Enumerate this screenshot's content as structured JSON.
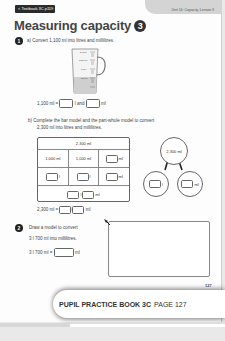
{
  "header": {
    "textbook_link": "< Textbook 3C p119",
    "unit_label": "Unit 14: Capacity, Lesson 3"
  },
  "title": {
    "text": "Measuring capacity",
    "lesson_number": "3"
  },
  "q1": {
    "number": "1",
    "part_a": {
      "label": "a)",
      "prompt": "Convert 1,100 ml into litres and millilitres.",
      "jug_scale": [
        "2 litres",
        "1,500 ml",
        "1 litre",
        "500 ml"
      ],
      "answer_prefix": "1,100 ml =",
      "unit_l_and": "l and",
      "unit_ml": "ml"
    },
    "part_b": {
      "label": "b)",
      "prompt_line1": "Complete the bar model and the part-whole model to convert",
      "prompt_line2": "2,300 ml into litres and millilitres.",
      "bar_model": {
        "whole": "2,300 ml",
        "row2": [
          "1,000 ml",
          "1,000 ml",
          "ml"
        ],
        "row3_units": [
          "l",
          "l",
          "ml"
        ],
        "row4_units": [
          "l",
          "ml"
        ]
      },
      "part_whole": {
        "whole": "2,300 ml",
        "part1_unit": "l",
        "part2_unit": "ml"
      },
      "answer_prefix": "2,300 ml =",
      "unit_l": "l",
      "unit_ml": "ml"
    }
  },
  "q2": {
    "number": "2",
    "line1": "Draw a model to convert",
    "line2": "3 l 700 ml into millilitres.",
    "answer_prefix": "3 l 700 ml =",
    "unit_ml": "ml"
  },
  "footer": {
    "page_number": "127",
    "badge_bold": "PUPIL PRACTICE BOOK 3C",
    "badge_page": "PAGE 127"
  }
}
